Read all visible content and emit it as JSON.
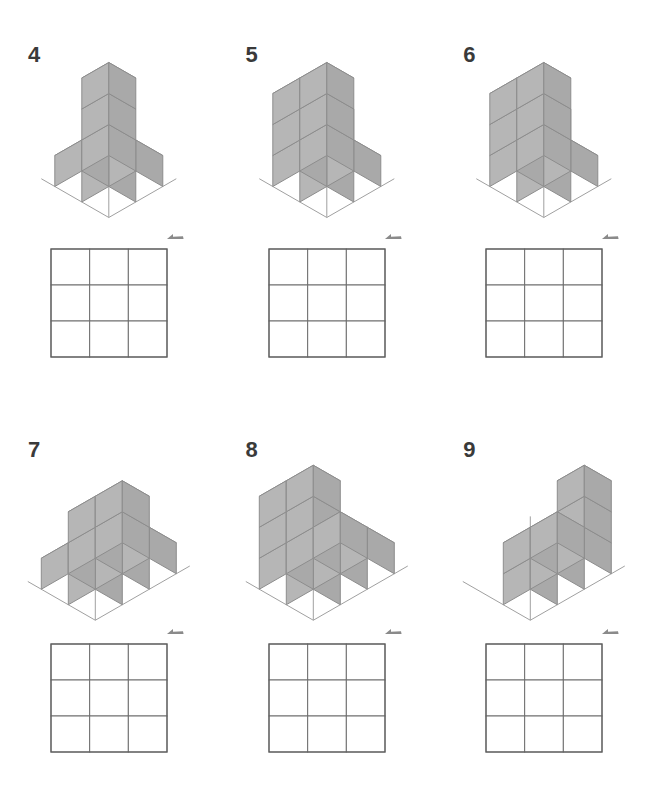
{
  "page": {
    "background_color": "#ffffff",
    "width": 653,
    "height": 788
  },
  "style": {
    "cube_top_color": "#d3d3d3",
    "cube_left_color": "#b6b6b6",
    "cube_right_color": "#a9a9a9",
    "cube_stroke_color": "#8d8d8d",
    "axis_color": "#a0a0a0",
    "grid_line_color": "#6e6e6e",
    "grid_outer_color": "#5f5f5f",
    "number_color": "#3a3a3a",
    "arrow_color": "#8a8a8a"
  },
  "legend": {
    "arrow_icon_name": "view-direction-arrow",
    "grid_rows": 3,
    "grid_cols": 3
  },
  "problems": [
    {
      "number": "4",
      "id": "problem-4",
      "cube_count": 6,
      "description": "Two-step staircase: an L-shaped base of four cubes with a two-high column at the back right",
      "voxels": [
        [
          0,
          0,
          0
        ],
        [
          1,
          0,
          0
        ],
        [
          1,
          1,
          0
        ],
        [
          0,
          1,
          0
        ],
        [
          1,
          1,
          1
        ],
        [
          1,
          1,
          2
        ]
      ],
      "arrow": {
        "x": 176,
        "y": 205
      }
    },
    {
      "number": "5",
      "id": "problem-5",
      "cube_count": 10,
      "description": "Two-by-two tower three cubes high with the front-top corner cube removed",
      "voxels": [
        [
          0,
          0,
          0
        ],
        [
          1,
          0,
          0
        ],
        [
          0,
          1,
          0
        ],
        [
          1,
          1,
          0
        ],
        [
          0,
          0,
          1
        ],
        [
          0,
          1,
          1
        ],
        [
          1,
          1,
          1
        ],
        [
          0,
          0,
          2
        ],
        [
          0,
          1,
          2
        ],
        [
          1,
          1,
          2
        ]
      ],
      "arrow": {
        "x": 176,
        "y": 205
      }
    },
    {
      "number": "6",
      "id": "problem-6",
      "cube_count": 10,
      "description": "Flat wall two wide and three high with the middle front cube removed",
      "voxels": [
        [
          0,
          1,
          0
        ],
        [
          1,
          1,
          0
        ],
        [
          0,
          0,
          0
        ],
        [
          1,
          0,
          0
        ],
        [
          0,
          1,
          1
        ],
        [
          1,
          1,
          1
        ],
        [
          0,
          0,
          1
        ],
        [
          0,
          1,
          2
        ],
        [
          1,
          1,
          2
        ],
        [
          0,
          0,
          2
        ]
      ],
      "arrow": {
        "x": 176,
        "y": 205
      }
    },
    {
      "number": "7",
      "id": "problem-7",
      "cube_count": 8,
      "description": "Three-wide block two deep with a single cube stepping up at the back",
      "voxels": [
        [
          0,
          0,
          0
        ],
        [
          1,
          0,
          0
        ],
        [
          2,
          0,
          0
        ],
        [
          0,
          1,
          0
        ],
        [
          1,
          1,
          0
        ],
        [
          2,
          1,
          0
        ],
        [
          1,
          1,
          1
        ],
        [
          2,
          1,
          1
        ]
      ],
      "arrow": {
        "x": 176,
        "y": 205
      }
    },
    {
      "number": "8",
      "id": "problem-8",
      "cube_count": 11,
      "description": "Descending staircase: three levels stepping down toward the front right",
      "voxels": [
        [
          0,
          0,
          0
        ],
        [
          1,
          0,
          0
        ],
        [
          2,
          0,
          0
        ],
        [
          0,
          1,
          0
        ],
        [
          1,
          1,
          0
        ],
        [
          2,
          1,
          0
        ],
        [
          0,
          0,
          1
        ],
        [
          0,
          1,
          1
        ],
        [
          1,
          1,
          1
        ],
        [
          0,
          1,
          2
        ],
        [
          1,
          1,
          2
        ]
      ],
      "arrow": {
        "x": 176,
        "y": 205
      }
    },
    {
      "number": "9",
      "id": "problem-9",
      "cube_count": 7,
      "description": "Low two-cube arm in front with a three-high column at the right",
      "voxels": [
        [
          0,
          0,
          0
        ],
        [
          1,
          0,
          0
        ],
        [
          2,
          0,
          0
        ],
        [
          1,
          1,
          0
        ],
        [
          2,
          0,
          1
        ],
        [
          2,
          0,
          2
        ],
        [
          2,
          1,
          0
        ]
      ],
      "arrow": {
        "x": 176,
        "y": 205
      }
    }
  ]
}
